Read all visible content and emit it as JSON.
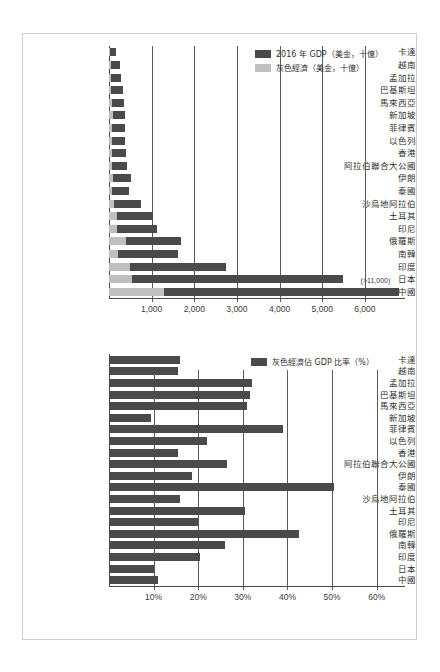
{
  "figure": {
    "background_color": "#ffffff",
    "frame_color": "#cfcfcf",
    "dark_color": "#4a4a4a",
    "light_color": "#bfbfbf"
  },
  "chart_data": [
    {
      "type": "bar",
      "orientation": "horizontal",
      "stacked": true,
      "title": "",
      "xlabel": "",
      "ylabel": "",
      "xlim": [
        0,
        6800
      ],
      "grid": true,
      "legend_position": "top-right",
      "xticks": [
        1000,
        2000,
        3000,
        4000,
        5000,
        6000
      ],
      "xtick_labels": [
        "1,000",
        "2,000",
        "3,000",
        "4,000",
        "5,000",
        "6,000"
      ],
      "categories": [
        "卡達",
        "越南",
        "孟加拉",
        "巴基斯坦",
        "馬來西亞",
        "新加坡",
        "菲律賓",
        "以色列",
        "香港",
        "阿拉伯聯合大公國",
        "伊朗",
        "泰國",
        "沙烏地阿拉伯",
        "土耳其",
        "印尼",
        "俄羅斯",
        "南韓",
        "印度",
        "日本",
        "中國"
      ],
      "series": [
        {
          "name": "灰色經濟（美金，十億）",
          "color": "#bfbfbf",
          "values": [
            20,
            45,
            55,
            50,
            60,
            90,
            65,
            60,
            75,
            70,
            100,
            70,
            115,
            185,
            190,
            400,
            215,
            485,
            545,
            1300
          ]
        },
        {
          "name": "2016 年 GDP（美金，十億）",
          "color": "#4a4a4a",
          "values": [
            152,
            202,
            221,
            284,
            296,
            297,
            305,
            318,
            321,
            349,
            418,
            407,
            646,
            858,
            932,
            1281,
            1411,
            2264,
            4940,
            11218
          ]
        }
      ],
      "annotations": [
        {
          "text": "(>11,000)",
          "category": "中國",
          "x": 5900
        }
      ]
    },
    {
      "type": "bar",
      "orientation": "horizontal",
      "stacked": false,
      "title": "",
      "xlabel": "",
      "ylabel": "",
      "xlim": [
        0,
        65
      ],
      "grid": true,
      "legend_position": "top-right",
      "xticks": [
        10,
        20,
        30,
        40,
        50,
        60
      ],
      "xtick_labels": [
        "10%",
        "20%",
        "30%",
        "40%",
        "50%",
        "60%"
      ],
      "categories": [
        "卡達",
        "越南",
        "孟加拉",
        "巴基斯坦",
        "馬來西亞",
        "新加坡",
        "菲律賓",
        "以色列",
        "香港",
        "阿拉伯聯合大公國",
        "伊朗",
        "泰國",
        "沙烏地阿拉伯",
        "土耳其",
        "印尼",
        "俄羅斯",
        "南韓",
        "印度",
        "日本",
        "中國"
      ],
      "series": [
        {
          "name": "灰色經濟佔 GDP 比率（%）",
          "color": "#4a4a4a",
          "values": [
            16.0,
            15.5,
            32.0,
            31.5,
            31.0,
            9.5,
            39.0,
            22.0,
            15.5,
            26.5,
            18.5,
            50.5,
            16.0,
            30.5,
            20.0,
            42.5,
            26.0,
            20.5,
            10.0,
            11.0
          ]
        }
      ],
      "annotations": []
    }
  ],
  "top_chart": {
    "legend": [
      {
        "label": "2016 年 GDP（美金，十億）",
        "swatch": "dark"
      },
      {
        "label": "灰色經濟（美金，十億）",
        "swatch": "light"
      }
    ]
  },
  "bottom_chart": {
    "legend": [
      {
        "label": "灰色經濟佔 GDP 比率（%）",
        "swatch": "dark"
      }
    ]
  }
}
